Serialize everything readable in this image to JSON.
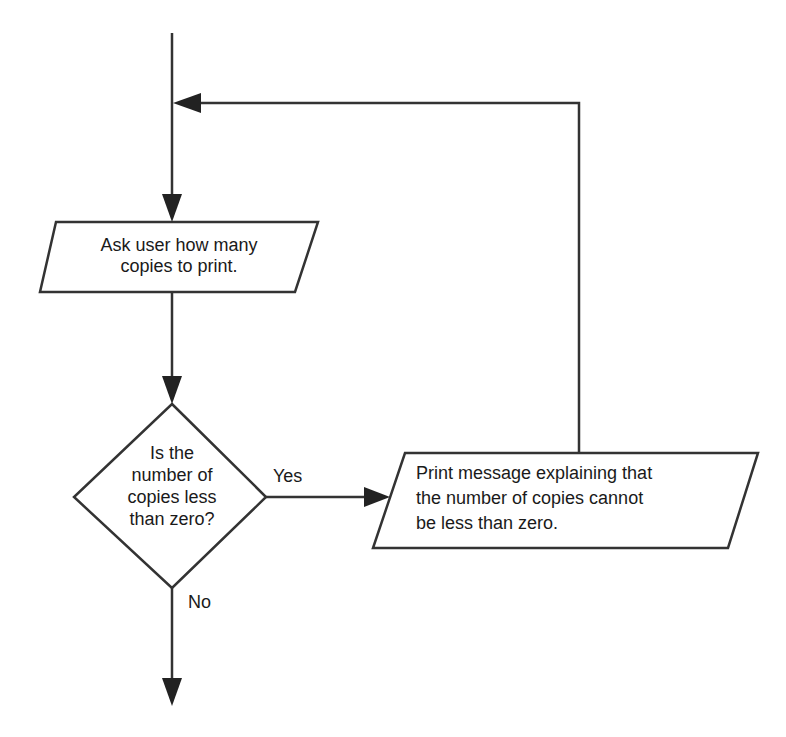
{
  "flowchart": {
    "nodes": {
      "input": {
        "type": "input-output",
        "lines": [
          "Ask user how many",
          "copies to print."
        ]
      },
      "decision": {
        "type": "decision",
        "lines": [
          "Is the",
          "number of",
          "copies less",
          "than zero?"
        ]
      },
      "output": {
        "type": "input-output",
        "lines": [
          "Print message explaining that",
          "the number of copies cannot",
          "be less than zero."
        ]
      }
    },
    "edges": {
      "yes_label": "Yes",
      "no_label": "No"
    },
    "colors": {
      "stroke": "#333333",
      "text": "#1a1a1a",
      "background": "#ffffff"
    }
  }
}
